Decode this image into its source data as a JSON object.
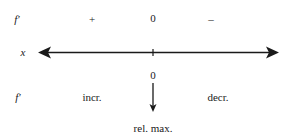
{
  "sign_chart": {
    "row_derivative": {
      "label": "f′",
      "left_sign": "+",
      "critical_value": "0",
      "right_sign": "–"
    },
    "axis": {
      "label": "x",
      "critical_point_marker": "tick"
    },
    "row_behavior": {
      "critical_value": "0",
      "label": "f′",
      "left_behavior": "incr.",
      "right_behavior": "decr."
    },
    "conclusion": "rel. max.",
    "icons": {
      "axis_left_arrow": "arrowhead-left-icon",
      "axis_right_arrow": "arrowhead-right-icon",
      "down_arrow": "arrow-down-icon"
    },
    "colors": {
      "ink": "#1a1a1a",
      "background": "#ffffff"
    }
  }
}
